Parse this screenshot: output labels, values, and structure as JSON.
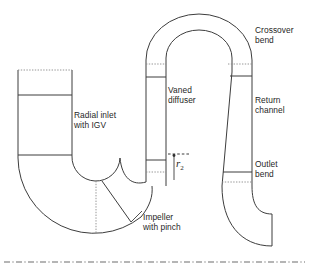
{
  "figure": {
    "background_color": "#ffffff",
    "line_color": "#3d3d3d",
    "dotted_color": "#8a8a8a",
    "centerline_color": "#6d6d6d",
    "width": 312,
    "height": 274
  },
  "labels": {
    "radial_inlet": "Radial inlet\nwith IGV",
    "vaned_diffuser": "Vaned\ndiffuser",
    "impeller": "Impeller\nwith pinch",
    "crossover_bend": "Crossover\nbend",
    "return_channel": "Return\nchannel",
    "outlet_bend": "Outlet\nbend",
    "radius_symbol": "r",
    "radius_subscript": "2"
  },
  "components": [
    {
      "name": "radial-inlet-with-igv",
      "label": "Radial inlet with IGV"
    },
    {
      "name": "impeller-with-pinch",
      "label": "Impeller with pinch"
    },
    {
      "name": "vaned-diffuser",
      "label": "Vaned diffuser"
    },
    {
      "name": "crossover-bend",
      "label": "Crossover bend"
    },
    {
      "name": "return-channel",
      "label": "Return channel"
    },
    {
      "name": "outlet-bend",
      "label": "Outlet bend"
    }
  ],
  "annotations": {
    "impeller_exit_radius": "r2",
    "machine_axis": "dash-dot centerline"
  }
}
